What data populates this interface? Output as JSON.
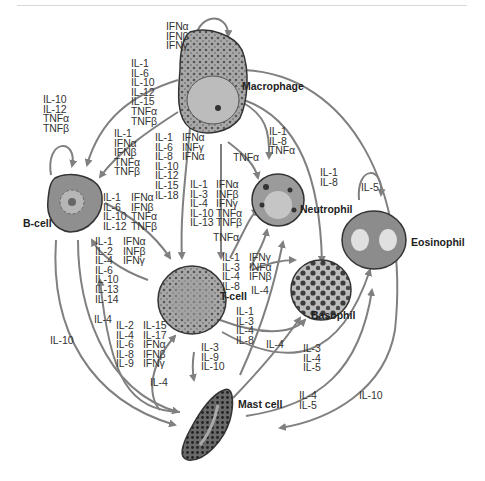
{
  "diagram": {
    "type": "cytokine-network",
    "cells": {
      "macrophage": {
        "label": "Macrophage"
      },
      "b_cell": {
        "label": "B-cell"
      },
      "t_cell": {
        "label": "T-cell"
      },
      "neutrophil": {
        "label": "Neutrophil"
      },
      "basophil": {
        "label": "Basophil"
      },
      "eosinophil": {
        "label": "Eosinophil"
      },
      "mast_cell": {
        "label": "Mast cell"
      }
    },
    "labels": {
      "mac_self": "IFNα\nIFNβ\nIFNγ",
      "mac_to_tcell_long": "IL-1\nIL-6\nIL-10\nIL-12\nIL-15\nTNFα\nTNFβ",
      "bcell_self": "IL-10\nIL-12\nTNFα\nTNFβ",
      "mac_to_bcell": "IL-1\nIFNα\nIFNβ\nTNFα\nTNFβ",
      "mac_to_tcell_a": "IL-1\nIL-6\nIL-8\nIL-10\nIL-12\nIL-15\nIL-18",
      "mac_to_tcell_b": "IFNα\nINFγ\nIFNα",
      "mac_to_neutrophil_tnf": "TNFα",
      "mac_to_neutrophil": "IL-1\nIL-8\nTNFα",
      "mac_to_basophil": "IL-1\nIL-8",
      "eosinophil_self": "IL-5",
      "bcell_to_tcell_a": "IL-1\nIL-6\nIL-10\nIL-12",
      "bcell_to_tcell_b": "IFNα\nIFNβ\nTNFα\nTNFβ",
      "tcell_to_neutrophil_a": "IL-1\nIL-3\nIL-4\nIL-10\nIL-13",
      "tcell_to_neutrophil_b": "IFNα\nINFβ\nIFNγ\nTNFα\nTNFβ",
      "tcell_tnf": "TNFα",
      "tcell_to_bcell_a": "IL-1\nIL-2\nIL-4\nIL-6\nIL-10\nIL-13\nIL-14",
      "tcell_to_bcell_b": "IFNα\nINFβ\nIFNγ",
      "tcell_to_basophil_a": "IL-1\nIL-3\nIL-4\nIL-8",
      "tcell_to_basophil_b": "IFNγ\nINFα\nIFNβ",
      "tcell_il4": "IL-4",
      "bcell_il4": "IL-4",
      "bcell_il10": "IL-10",
      "mast_to_tcell_a": "IL-2\nIL-4\nIL-6\nIL-8\nIL-9",
      "mast_to_tcell_b": "IL-15\nIL-17\nIFNα\nIFNβ\nIFNγ",
      "tcell_to_basophil_c": "IL-1\nIL-3\nIL-4\nIL-8",
      "tcell_to_mast": "IL-3\nIL-9\nIL-10",
      "mast_il4_a": "IL-4",
      "tcell_to_eos": "IL-3\nIL-4\nIL-5",
      "mast_il4_b": "IL-4",
      "mast_to_eos": "IL-4\nIL-5",
      "eos_to_mast": "IL-10"
    },
    "colors": {
      "arrow": "#808080",
      "cell_outline": "#333333",
      "cell_fill": "#9a9a9a"
    }
  }
}
